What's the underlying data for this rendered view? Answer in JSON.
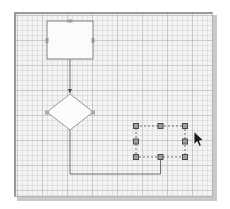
{
  "app": {
    "title": "Diagram Canvas",
    "surface_label": "drawing-canvas"
  },
  "canvas": {
    "x": 14,
    "y": 12,
    "width": 199,
    "height": 185,
    "background_color": "#f3f3f3",
    "border_color": "#9a9a9a",
    "grid": {
      "visible": true,
      "minor_spacing": 5,
      "major_spacing": 25,
      "minor_color": "#bcbcc4",
      "major_color": "#aaaab6"
    }
  },
  "shapes": [
    {
      "id": "process-node",
      "type": "rectangle",
      "label": "",
      "x": 31,
      "y": 7,
      "width": 46,
      "height": 38,
      "fill": "#fbfbfb",
      "stroke": "#808080",
      "stroke_width": 1,
      "selected": false,
      "connection_points": [
        {
          "x": 54,
          "y": 7
        },
        {
          "x": 31,
          "y": 26
        },
        {
          "x": 77,
          "y": 26
        },
        {
          "x": 54,
          "y": 45
        }
      ]
    },
    {
      "id": "decision-node",
      "type": "diamond",
      "label": "",
      "x": 31,
      "y": 80,
      "width": 46,
      "height": 36,
      "fill": "#fbfbfb",
      "stroke": "#9a9a9a",
      "stroke_width": 1,
      "selected": false,
      "connection_points": [
        {
          "x": 54,
          "y": 80
        },
        {
          "x": 31,
          "y": 98
        },
        {
          "x": 77,
          "y": 98
        },
        {
          "x": 54,
          "y": 116
        }
      ]
    },
    {
      "id": "selected-node",
      "type": "rectangle",
      "label": "",
      "x": 120,
      "y": 112,
      "width": 49,
      "height": 31,
      "fill": "transparent",
      "stroke": "#6e6e6e",
      "stroke_width": 1,
      "stroke_dash": "2,2",
      "selected": true
    }
  ],
  "selection": {
    "target_shape_id": "selected-node",
    "outline_color": "#6e6e6e",
    "outline_dash": "2,2",
    "handle_size": 5,
    "handle_fill": "#9e9e9e",
    "handle_stroke": "#4a4a4a",
    "handles": [
      {
        "name": "handle-top-left",
        "x": 120,
        "y": 112
      },
      {
        "name": "handle-top-center",
        "x": 144.5,
        "y": 112
      },
      {
        "name": "handle-top-right",
        "x": 169,
        "y": 112
      },
      {
        "name": "handle-middle-left",
        "x": 120,
        "y": 127.5
      },
      {
        "name": "handle-middle-right",
        "x": 169,
        "y": 127.5
      },
      {
        "name": "handle-bottom-left",
        "x": 120,
        "y": 143
      },
      {
        "name": "handle-bottom-center",
        "x": 144.5,
        "y": 143
      },
      {
        "name": "handle-bottom-right",
        "x": 169,
        "y": 143
      }
    ]
  },
  "connectors": [
    {
      "id": "connector-process-to-decision",
      "points": "54,45 54,79",
      "stroke": "#6e6e6e",
      "stroke_width": 1,
      "arrowhead": "filled-triangle",
      "arrow_at": {
        "x": 54,
        "y": 80
      }
    },
    {
      "id": "connector-decision-to-selected",
      "points": "54,116 54,160 144.5,160 144.5,143",
      "stroke": "#6e6e6e",
      "stroke_width": 1,
      "arrowhead": "none"
    }
  ],
  "cursor": {
    "type": "arrow-pointer",
    "x": 193,
    "y": 131,
    "fill": "#1a1a1a",
    "stroke": "#ffffff"
  }
}
